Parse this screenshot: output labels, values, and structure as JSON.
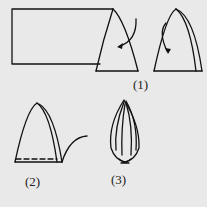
{
  "diagram": {
    "background": "#e9e9e9",
    "stroke_color": "#111111",
    "steps": [
      {
        "id": "step-1",
        "label": "(1)",
        "description": "Rectangle rolled into cone; fold arrows"
      },
      {
        "id": "step-2",
        "label": "(2)",
        "description": "Cone with dashed base line and trailing curve"
      },
      {
        "id": "step-3",
        "label": "(3)",
        "description": "Finished bud shape"
      }
    ]
  }
}
